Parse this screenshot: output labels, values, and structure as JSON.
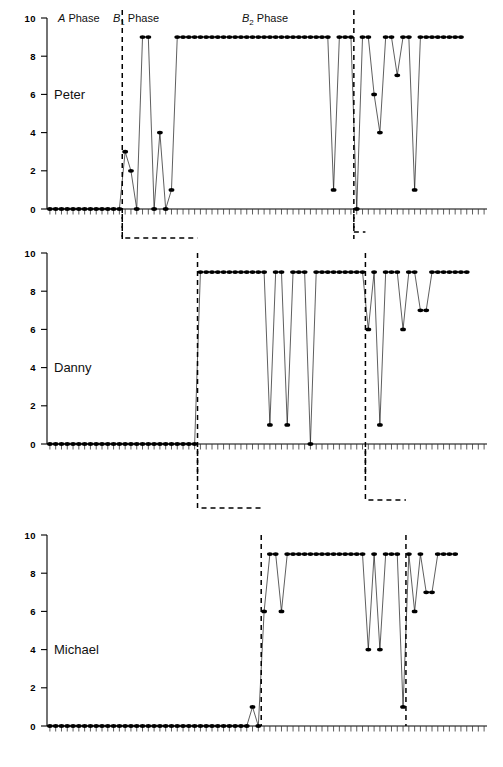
{
  "figure": {
    "title": "",
    "axis": {
      "y_ticks": [
        "0",
        "2",
        "4",
        "6",
        "8",
        "10"
      ],
      "y_min": 0,
      "y_max": 10,
      "y_label": "",
      "x_label": "",
      "grid": false
    },
    "phase_labels": [
      {
        "id": "a-phase",
        "prefix": "A",
        "sub": "",
        "suffix": " Phase",
        "x": 58
      },
      {
        "id": "b1-phase",
        "prefix": "B",
        "sub": "1",
        "suffix": " Phase",
        "x": 113
      },
      {
        "id": "b2-phase",
        "prefix": "B",
        "sub": "2",
        "suffix": " Phase",
        "x": 242
      }
    ]
  },
  "chart_data": {
    "type": "line",
    "xlabel": "Sessions",
    "ylabel": "",
    "ylim": [
      0,
      10
    ],
    "grid": false,
    "legend": "none",
    "marker": "filled-circle",
    "phases": [
      "A Phase",
      "B1 Phase",
      "B2 Phase"
    ],
    "panels": [
      {
        "name": "Peter",
        "phase_breaks": [
          13,
          53
        ],
        "values": [
          0,
          0,
          0,
          0,
          0,
          0,
          0,
          0,
          0,
          0,
          0,
          0,
          0,
          3,
          2,
          0,
          9,
          9,
          0,
          4,
          0,
          1,
          9,
          9,
          9,
          9,
          9,
          9,
          9,
          9,
          9,
          9,
          9,
          9,
          9,
          9,
          9,
          9,
          9,
          9,
          9,
          9,
          9,
          9,
          9,
          9,
          9,
          9,
          9,
          1,
          9,
          9,
          9,
          0,
          9,
          9,
          6,
          4,
          9,
          9,
          7,
          9,
          9,
          1,
          9,
          9,
          9,
          9,
          9,
          9,
          9,
          9
        ]
      },
      {
        "name": "Danny",
        "phase_breaks": [
          26,
          55
        ],
        "values": [
          0,
          0,
          0,
          0,
          0,
          0,
          0,
          0,
          0,
          0,
          0,
          0,
          0,
          0,
          0,
          0,
          0,
          0,
          0,
          0,
          0,
          0,
          0,
          0,
          0,
          0,
          9,
          9,
          9,
          9,
          9,
          9,
          9,
          9,
          9,
          9,
          9,
          9,
          1,
          9,
          9,
          1,
          9,
          9,
          9,
          0,
          9,
          9,
          9,
          9,
          9,
          9,
          9,
          9,
          9,
          6,
          9,
          1,
          9,
          9,
          9,
          6,
          9,
          9,
          7,
          7,
          9,
          9,
          9,
          9,
          9,
          9,
          9
        ]
      },
      {
        "name": "Michael",
        "phase_breaks": [
          37,
          62
        ],
        "values": [
          0,
          0,
          0,
          0,
          0,
          0,
          0,
          0,
          0,
          0,
          0,
          0,
          0,
          0,
          0,
          0,
          0,
          0,
          0,
          0,
          0,
          0,
          0,
          0,
          0,
          0,
          0,
          0,
          0,
          0,
          0,
          0,
          0,
          0,
          0,
          1,
          0,
          6,
          9,
          9,
          6,
          9,
          9,
          9,
          9,
          9,
          9,
          9,
          9,
          9,
          9,
          9,
          9,
          9,
          9,
          4,
          9,
          4,
          9,
          9,
          9,
          1,
          9,
          6,
          9,
          7,
          7,
          9,
          9,
          9,
          9
        ]
      }
    ]
  },
  "panels": [
    {
      "id": "peter",
      "label": "Peter"
    },
    {
      "id": "danny",
      "label": "Danny"
    },
    {
      "id": "michael",
      "label": "Michael"
    }
  ]
}
